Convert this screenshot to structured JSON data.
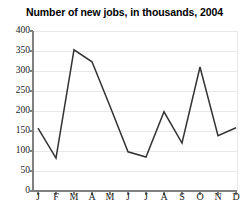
{
  "chart_data": {
    "type": "line",
    "title": "Number of new jobs, in thousands, 2004",
    "xlabel": "",
    "ylabel": "",
    "categories": [
      "J",
      "F",
      "M",
      "A",
      "M",
      "J",
      "J",
      "A",
      "S",
      "O",
      "N",
      "D"
    ],
    "values": [
      157,
      82,
      353,
      323,
      212,
      98,
      85,
      198,
      120,
      310,
      138,
      158
    ],
    "ylim": [
      0,
      400
    ],
    "yticks": [
      0,
      50,
      100,
      150,
      200,
      250,
      300,
      350,
      400
    ],
    "ytick_labels": [
      "0",
      "50",
      "100",
      "150",
      "200",
      "250",
      "300",
      "350",
      "400"
    ],
    "grid": true,
    "grid_axis": "y",
    "legend": false,
    "series": [
      {
        "name": "New jobs",
        "values": [
          157,
          82,
          353,
          323,
          212,
          98,
          85,
          198,
          120,
          310,
          138,
          158
        ]
      }
    ]
  },
  "colors": {
    "line": "#333333",
    "axis": "#808080",
    "grid": "#e8e8e8",
    "text": "#1a1a1a",
    "title": "#000000",
    "background": "#ffffff"
  }
}
